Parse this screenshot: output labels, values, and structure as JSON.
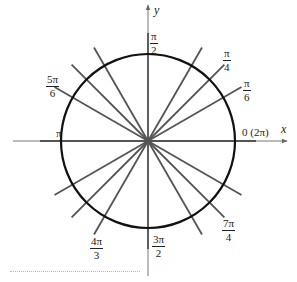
{
  "diagram": {
    "center": [
      148,
      141
    ],
    "circle_radius": 87,
    "ray_length": 108,
    "colors": {
      "circle": "#111111",
      "rays": "#555555",
      "axes": "#666666",
      "text": "#222222"
    },
    "axes": {
      "x_label": "x",
      "y_label": "y"
    },
    "angles_deg": [
      0,
      30,
      45,
      60,
      90,
      120,
      135,
      150,
      180,
      210,
      225,
      240,
      270,
      300,
      315,
      330
    ],
    "labels": {
      "zero": "0 (2π)",
      "pi": "π",
      "pi_over_2": {
        "num": "π",
        "den": "2"
      },
      "pi_over_4": {
        "num": "π",
        "den": "4"
      },
      "pi_over_6": {
        "num": "π",
        "den": "6"
      },
      "five_pi_over_6": {
        "num": "5π",
        "den": "6"
      },
      "four_pi_over_3": {
        "num": "4π",
        "den": "3"
      },
      "three_pi_over_2": {
        "num": "3π",
        "den": "2"
      },
      "seven_pi_over_4": {
        "num": "7π",
        "den": "4"
      }
    }
  }
}
